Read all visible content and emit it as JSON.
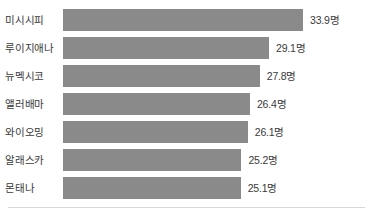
{
  "chart_data": {
    "type": "bar",
    "orientation": "horizontal",
    "title": "",
    "subtitle": "",
    "xlabel": "",
    "ylabel": "",
    "categories": [
      "미시시피",
      "루이지애나",
      "뉴멕시코",
      "앨러배마",
      "와이오밍",
      "알래스카",
      "몬태나"
    ],
    "values": [
      33.9,
      29.1,
      27.8,
      26.4,
      26.1,
      25.2,
      25.1
    ],
    "value_labels": [
      "33.9명",
      "29.1명",
      "27.8명",
      "26.4명",
      "26.1명",
      "25.2명",
      "25.1명"
    ],
    "unit_suffix": "명",
    "xlim": [
      0,
      33.9
    ],
    "grid": false,
    "legend": null,
    "tick_labels": [],
    "annotations": [],
    "bar_color": "#8a8a8a",
    "text_color": "#3a3a3a",
    "background_color": "#ffffff",
    "divider_color": "#d8d8d8"
  },
  "layout": {
    "bar_start_x": 63,
    "bar_height": 22,
    "row_pitch": 28,
    "first_row_top": 9,
    "max_bar_width": 240,
    "value_gap": 7,
    "divider_top": 207
  }
}
